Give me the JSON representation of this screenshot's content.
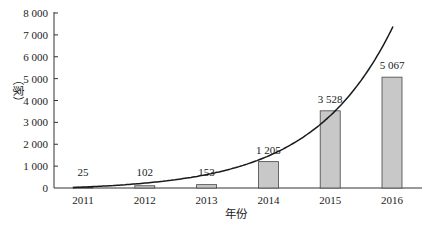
{
  "chart_data": {
    "type": "bar",
    "title": "",
    "xlabel": "年份",
    "ylabel": "（家）",
    "categories": [
      "2011",
      "2012",
      "2013",
      "2014",
      "2015",
      "2016"
    ],
    "values": [
      25,
      102,
      153,
      1205,
      3528,
      5067
    ],
    "value_labels": [
      "25",
      "102",
      "153",
      "1 205",
      "3 528",
      "5 067"
    ],
    "ylim": [
      0,
      8000
    ],
    "yticks": [
      0,
      1000,
      2000,
      3000,
      4000,
      5000,
      6000,
      7000,
      8000
    ],
    "ytick_labels": [
      "0",
      "1 000",
      "2 000",
      "3 000",
      "4 000",
      "5 000",
      "6 000",
      "7 000",
      "8 000"
    ],
    "grid": false,
    "legend": null,
    "overlay": {
      "type": "line",
      "description": "exponential trend curve",
      "style": "smooth black curve"
    }
  },
  "colors": {
    "bar_fill": "#c8c8c8",
    "bar_stroke": "#444444",
    "curve": "#1a1a1a",
    "axis": "#333333"
  }
}
